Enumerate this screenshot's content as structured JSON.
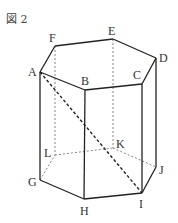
{
  "figure": {
    "label": "図 2"
  },
  "vertices": {
    "A": {
      "label": "A",
      "x": 40,
      "y": 72,
      "lx": 28,
      "ly": 76
    },
    "B": {
      "label": "B",
      "x": 85,
      "y": 90,
      "lx": 81,
      "ly": 85
    },
    "C": {
      "label": "C",
      "x": 142,
      "y": 84,
      "lx": 133,
      "ly": 79
    },
    "D": {
      "label": "D",
      "x": 156,
      "y": 58,
      "lx": 159,
      "ly": 62
    },
    "E": {
      "label": "E",
      "x": 113,
      "y": 39,
      "lx": 108,
      "ly": 35
    },
    "F": {
      "label": "F",
      "x": 55,
      "y": 46,
      "lx": 49,
      "ly": 42
    },
    "G": {
      "label": "G",
      "x": 40,
      "y": 180,
      "lx": 28,
      "ly": 186
    },
    "H": {
      "label": "H",
      "x": 84,
      "y": 199,
      "lx": 80,
      "ly": 215
    },
    "I": {
      "label": "I",
      "x": 142,
      "y": 193,
      "lx": 139,
      "ly": 208
    },
    "J": {
      "label": "J",
      "x": 156,
      "y": 167,
      "lx": 159,
      "ly": 174
    },
    "K": {
      "label": "K",
      "x": 113,
      "y": 148,
      "lx": 116,
      "ly": 148
    },
    "L": {
      "label": "L",
      "x": 55,
      "y": 155,
      "lx": 44,
      "ly": 157
    }
  },
  "edges": {
    "solid": [
      [
        "A",
        "B"
      ],
      [
        "B",
        "C"
      ],
      [
        "C",
        "D"
      ],
      [
        "D",
        "E"
      ],
      [
        "E",
        "F"
      ],
      [
        "F",
        "A"
      ],
      [
        "A",
        "G"
      ],
      [
        "B",
        "H"
      ],
      [
        "C",
        "I"
      ],
      [
        "D",
        "J"
      ],
      [
        "G",
        "H"
      ],
      [
        "H",
        "I"
      ],
      [
        "I",
        "J"
      ]
    ],
    "hidden": [
      [
        "F",
        "L"
      ],
      [
        "E",
        "K"
      ],
      [
        "G",
        "L"
      ],
      [
        "L",
        "K"
      ],
      [
        "K",
        "J"
      ]
    ],
    "diagonal": [
      [
        "A",
        "I"
      ]
    ]
  }
}
